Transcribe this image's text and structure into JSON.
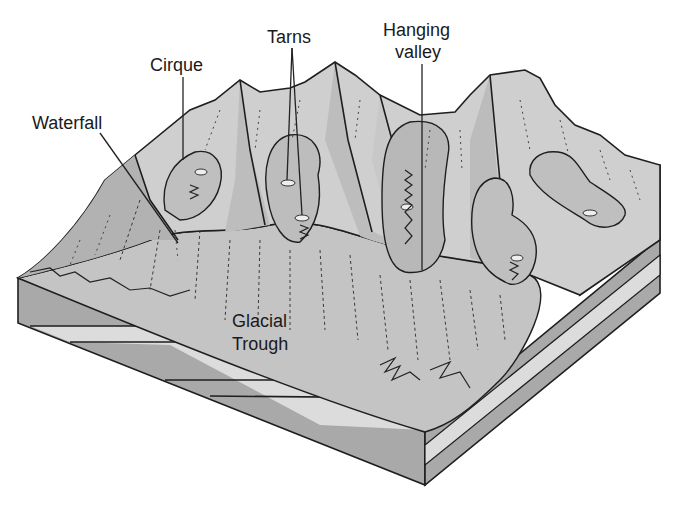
{
  "figure": {
    "labels": {
      "waterfall": "Waterfall",
      "cirque": "Cirque",
      "tarns": "Tarns",
      "hanging_valley_line1": "Hanging",
      "hanging_valley_line2": "valley",
      "glacial_trough_line1": "Glacial",
      "glacial_trough_line2": "Trough"
    },
    "colors": {
      "background": "#ffffff",
      "mountain_light": "#d2d2d2",
      "mountain_mid": "#bcbcbc",
      "mountain_dark": "#a8a8a8",
      "valley_floor": "#c4c4c4",
      "strata_dark": "#a9a9a9",
      "strata_light": "#dcdcdc",
      "ink": "#1e1e1e"
    }
  }
}
